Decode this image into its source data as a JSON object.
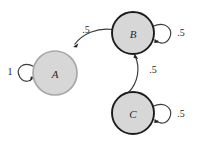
{
  "diagram": {
    "kind": "markov-chain-state-diagram",
    "background_color": "#ffffff",
    "width": 199,
    "height": 144,
    "node_fill_color": "#d7d7d7",
    "dark_stroke_color": "#1c1c1c",
    "light_stroke_color": "#a8a8a8",
    "edge_color": "#3a3a3a",
    "text_color": "#242424",
    "nodes": [
      {
        "id": "A",
        "label": "A",
        "cx": 55,
        "cy": 73,
        "r": 22,
        "outline": "light"
      },
      {
        "id": "B",
        "label": "B",
        "cx": 133,
        "cy": 33,
        "r": 21,
        "outline": "dark"
      },
      {
        "id": "C",
        "label": "C",
        "cx": 133,
        "cy": 113,
        "r": 21,
        "outline": "dark"
      }
    ],
    "self_loops": [
      {
        "id": "loop-a",
        "node": "A",
        "label": "1",
        "side": "left",
        "label_x": 10,
        "label_y": 71
      },
      {
        "id": "loop-b",
        "node": "B",
        "label": ".5",
        "side": "right",
        "label_x": 181,
        "label_y": 32
      },
      {
        "id": "loop-c",
        "node": "C",
        "label": ".5",
        "side": "right",
        "label_x": 181,
        "label_y": 113
      }
    ],
    "edges": [
      {
        "id": "edge-b-a",
        "from": "B",
        "to": "A",
        "label": ".5",
        "label_x": 86,
        "label_y": 29
      },
      {
        "id": "edge-c-b",
        "from": "C",
        "to": "B",
        "label": ".5",
        "label_x": 153,
        "label_y": 69
      }
    ]
  }
}
